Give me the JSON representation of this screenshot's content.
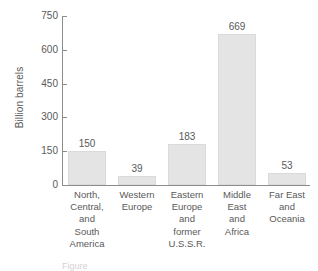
{
  "chart_data": {
    "type": "bar",
    "title": "",
    "xlabel": "",
    "ylabel": "Billion barrels",
    "ylim": [
      0,
      750
    ],
    "yticks": [
      0,
      150,
      300,
      450,
      600,
      750
    ],
    "ytick_labels": [
      "0",
      "150",
      "300",
      "450",
      "600",
      "750"
    ],
    "grid": false,
    "legend": "none",
    "categories": [
      "North, Central, and South America",
      "Western Europe",
      "Eastern Europe and former U.S.S.R.",
      "Middle East and Africa",
      "Far East and Oceania"
    ],
    "category_lines": [
      [
        "North,",
        "Central,",
        "and",
        "South",
        "America"
      ],
      [
        "Western",
        "Europe"
      ],
      [
        "Eastern",
        "Europe",
        "and",
        "former",
        "U.S.S.R."
      ],
      [
        "Middle",
        "East",
        "and",
        "Africa"
      ],
      [
        "Far East",
        "and",
        "Oceania"
      ]
    ],
    "values": [
      150,
      39,
      183,
      669,
      53
    ],
    "value_labels": [
      "150",
      "39",
      "183",
      "669",
      "53"
    ],
    "bar_color": "#e4e4e4",
    "bar_edge_color": "#dadada",
    "axis_color": "#8c8c8c",
    "text_color": "#595959"
  },
  "caption": {
    "clipped_text": "Figure"
  }
}
